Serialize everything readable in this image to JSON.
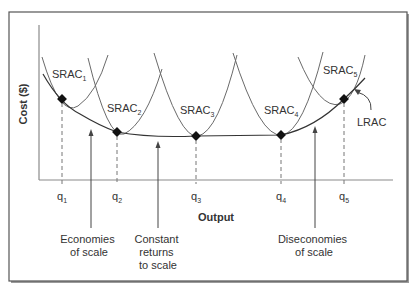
{
  "diagram": {
    "y_axis_label": "Cost ($)",
    "x_axis_label": "Output",
    "curves": [
      {
        "name": "SRAC",
        "sub": "1"
      },
      {
        "name": "SRAC",
        "sub": "2"
      },
      {
        "name": "SRAC",
        "sub": "3"
      },
      {
        "name": "SRAC",
        "sub": "4"
      },
      {
        "name": "SRAC",
        "sub": "5"
      }
    ],
    "lrac_label": "LRAC",
    "quantities": [
      {
        "name": "q",
        "sub": "1"
      },
      {
        "name": "q",
        "sub": "2"
      },
      {
        "name": "q",
        "sub": "3"
      },
      {
        "name": "q",
        "sub": "4"
      },
      {
        "name": "q",
        "sub": "5"
      }
    ],
    "regions": [
      {
        "lines": [
          "Economies",
          "of scale"
        ]
      },
      {
        "lines": [
          "Constant",
          "returns",
          "to scale"
        ]
      },
      {
        "lines": [
          "Diseconomies",
          "of scale"
        ]
      }
    ],
    "colors": {
      "frame": "#555555",
      "curve": "#6a6a6a",
      "lrac": "#333333",
      "text": "#333333",
      "point": "#111111"
    }
  }
}
